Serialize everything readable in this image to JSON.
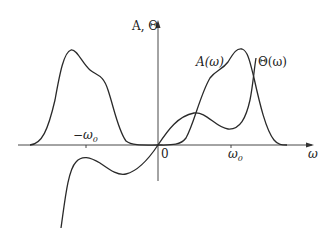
{
  "figure": {
    "y_axis_label": "A, Θ",
    "x_axis_label": "ω",
    "origin_label": "0",
    "tick_neg_label": "−ω",
    "tick_neg_sub": "0",
    "tick_pos_label": "ω",
    "tick_pos_sub": "0",
    "curve_A_label": "A(ω)",
    "curve_Theta_label": "Θ(ω)",
    "colors": {
      "line": "#2a2a2a",
      "axis": "#333333",
      "background": "#ffffff"
    }
  },
  "curves": [
    {
      "name": "A(ω)",
      "description": "amplitude spectrum, two symmetric humps peaked near ±ω0 with shoulders, zero near origin"
    },
    {
      "name": "Θ(ω)",
      "description": "phase spectrum, odd function through origin with local extrema, rising steeply near ω0 side"
    }
  ]
}
